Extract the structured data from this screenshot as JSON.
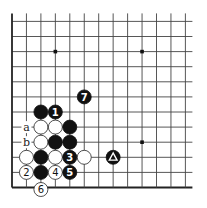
{
  "board": {
    "columns": 13,
    "rows": 12,
    "origin_x": 12,
    "origin_y": 187.5,
    "spacing_x": 14.45,
    "spacing_y": 15.1,
    "edges": [
      "left",
      "bottom"
    ],
    "stone_radius": 7,
    "colors": {
      "black": "#111111",
      "white": "#ffffff",
      "line": "#444444"
    }
  },
  "star_points": [
    {
      "col": 3,
      "row": 9
    },
    {
      "col": 9,
      "row": 9
    },
    {
      "col": 9,
      "row": 3
    }
  ],
  "stones": [
    {
      "color": "black",
      "col": 2,
      "row": 5,
      "label": ""
    },
    {
      "color": "black",
      "col": 3,
      "row": 5,
      "label": "1"
    },
    {
      "color": "white",
      "col": 2,
      "row": 4,
      "label": ""
    },
    {
      "color": "white",
      "col": 3,
      "row": 4,
      "label": ""
    },
    {
      "color": "black",
      "col": 4,
      "row": 4,
      "label": ""
    },
    {
      "color": "white",
      "col": 2,
      "row": 3,
      "label": ""
    },
    {
      "color": "black",
      "col": 3,
      "row": 3,
      "label": ""
    },
    {
      "color": "black",
      "col": 4,
      "row": 3,
      "label": ""
    },
    {
      "color": "white",
      "col": 1,
      "row": 2,
      "label": ""
    },
    {
      "color": "black",
      "col": 2,
      "row": 2,
      "label": ""
    },
    {
      "color": "white",
      "col": 3,
      "row": 2,
      "label": ""
    },
    {
      "color": "black",
      "col": 4,
      "row": 2,
      "label": "3"
    },
    {
      "color": "white",
      "col": 5,
      "row": 2,
      "label": ""
    },
    {
      "color": "black",
      "col": 7,
      "row": 2,
      "label": "",
      "marker": "triangle"
    },
    {
      "color": "white",
      "col": 1,
      "row": 1,
      "label": "2"
    },
    {
      "color": "black",
      "col": 2,
      "row": 1,
      "label": ""
    },
    {
      "color": "white",
      "col": 3,
      "row": 1,
      "label": "4"
    },
    {
      "color": "black",
      "col": 4,
      "row": 1,
      "label": "5"
    },
    {
      "color": "white",
      "col": 2,
      "row": 0,
      "label": "6"
    },
    {
      "color": "black",
      "col": 5,
      "row": 6,
      "label": "7"
    }
  ],
  "point_labels": [
    {
      "text": "a",
      "col": 1,
      "row": 4
    },
    {
      "text": "b",
      "col": 1,
      "row": 3
    }
  ]
}
